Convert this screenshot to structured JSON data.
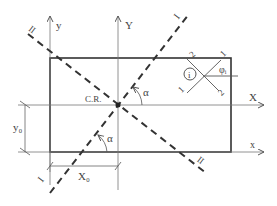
{
  "diagram": {
    "labels": {
      "y_axis_small": "y",
      "y_axis_big": "Y",
      "x_axis_big": "X",
      "x_axis_small": "x",
      "center_of_rotation": "C.R.",
      "angle_alpha_top": "α",
      "angle_alpha_bottom": "α",
      "line_I_top": "I",
      "line_I_bottom": "I",
      "line_II_top": "II",
      "line_II_bottom": "II",
      "dim_y0": "y₀",
      "dim_x0": "X₀",
      "element_i": "i",
      "phi_i": "φᵢ",
      "fiber_1_top": "1",
      "fiber_1_bottom": "1",
      "fiber_2_top": "2",
      "fiber_2_bottom": "2"
    },
    "colors": {
      "stroke": "#333333",
      "thin": "#777777",
      "text": "#444444"
    }
  }
}
